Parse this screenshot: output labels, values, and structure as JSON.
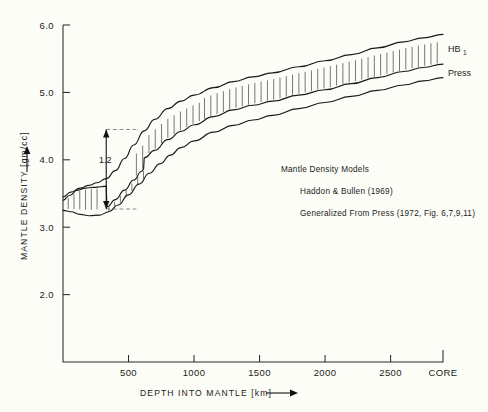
{
  "chart_data": {
    "type": "line",
    "title": "",
    "xlabel": "DEPTH INTO MANTLE [km]",
    "ylabel": "MANTLE DENSITY [gm/cc]",
    "xlim": [
      0,
      2900
    ],
    "ylim": [
      1.0,
      6.0
    ],
    "grid": false,
    "legend_position": "right-inline",
    "x_ticks": [
      {
        "value": 500,
        "label": "500"
      },
      {
        "value": 1000,
        "label": "1000"
      },
      {
        "value": 1500,
        "label": "1500"
      },
      {
        "value": 2000,
        "label": "2000"
      },
      {
        "value": 2500,
        "label": "2500"
      },
      {
        "value": 2900,
        "label": "CORE"
      }
    ],
    "y_ticks": [
      {
        "value": 2.0,
        "label": "2.0"
      },
      {
        "value": 3.0,
        "label": "3.0"
      },
      {
        "value": 4.0,
        "label": "4.0"
      },
      {
        "value": 5.0,
        "label": "5.0"
      },
      {
        "value": 6.0,
        "label": "6.0"
      }
    ],
    "series": [
      {
        "name": "HB1",
        "label": "HB",
        "label_sub": "1",
        "role": "upper-bound",
        "x": [
          0,
          60,
          130,
          200,
          260,
          330,
          400,
          470,
          540,
          620,
          700,
          800,
          900,
          1000,
          1150,
          1300,
          1450,
          1600,
          1800,
          2000,
          2200,
          2400,
          2600,
          2750,
          2900
        ],
        "y": [
          3.45,
          3.52,
          3.58,
          3.62,
          3.66,
          3.72,
          3.84,
          4.02,
          4.22,
          4.43,
          4.6,
          4.76,
          4.87,
          4.96,
          5.07,
          5.16,
          5.23,
          5.29,
          5.38,
          5.47,
          5.56,
          5.66,
          5.75,
          5.81,
          5.86
        ]
      },
      {
        "name": "Press",
        "label": "Press",
        "role": "middle-curve",
        "x": [
          0,
          50,
          110,
          170,
          230,
          290,
          330,
          335,
          400,
          470,
          540,
          600,
          615,
          620,
          700,
          800,
          900,
          1000,
          1150,
          1300,
          1450,
          1600,
          1800,
          2000,
          2200,
          2400,
          2600,
          2750,
          2900
        ],
        "y": [
          3.4,
          3.47,
          3.55,
          3.58,
          3.59,
          3.6,
          3.61,
          3.3,
          3.41,
          3.55,
          3.7,
          3.83,
          3.86,
          4.03,
          4.14,
          4.3,
          4.42,
          4.52,
          4.64,
          4.74,
          4.81,
          4.87,
          4.96,
          5.04,
          5.13,
          5.22,
          5.31,
          5.37,
          5.42
        ]
      },
      {
        "name": "lower-bound",
        "label": "",
        "role": "lower-bound",
        "x": [
          0,
          60,
          130,
          200,
          280,
          350,
          420,
          500,
          580,
          660,
          740,
          820,
          900,
          1000,
          1150,
          1300,
          1450,
          1600,
          1800,
          2000,
          2200,
          2400,
          2600,
          2750,
          2900
        ],
        "y": [
          3.25,
          3.23,
          3.19,
          3.17,
          3.18,
          3.23,
          3.33,
          3.48,
          3.64,
          3.8,
          3.94,
          4.07,
          4.18,
          4.28,
          4.41,
          4.51,
          4.59,
          4.66,
          4.76,
          4.85,
          4.94,
          5.03,
          5.11,
          5.17,
          5.22
        ]
      }
    ],
    "annotations": [
      {
        "name": "density-jump",
        "text": "1.2",
        "type": "double-arrow-vertical",
        "x": 330,
        "y_top": 4.45,
        "y_bottom": 3.27
      },
      {
        "name": "upper-guide",
        "type": "dashed-horizontal",
        "y": 4.45,
        "x_from": 330,
        "x_to": 560
      },
      {
        "name": "lower-guide",
        "type": "dashed-horizontal",
        "y": 3.27,
        "x_from": 330,
        "x_to": 560
      }
    ],
    "notes": [
      "Mantle Density Models",
      "Haddon & Bullen (1969)",
      "Generalized From Press (1972, Fig. 6,7,9,11)"
    ]
  },
  "figure": {
    "background_color": "#fdfdf7",
    "line_color": "#1a1a1a",
    "hatch_color": "#4a4a4a"
  }
}
